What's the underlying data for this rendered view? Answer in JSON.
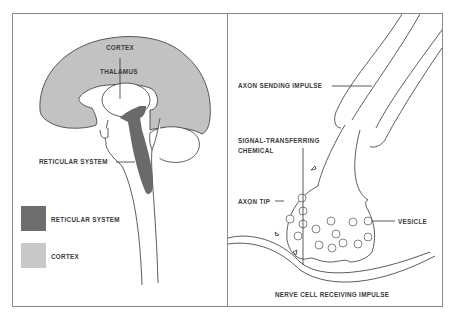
{
  "left_panel": {
    "title": "Brain cross-section",
    "labels": {
      "cortex": "CORTEX",
      "thalamus": "THALAMUS",
      "reticular_system": "RETICULAR SYSTEM"
    },
    "legend": [
      {
        "label": "RETICULAR  SYSTEM",
        "color": "#6e6e6e"
      },
      {
        "label": "CORTEX",
        "color": "#c8c8c8"
      }
    ]
  },
  "right_panel": {
    "title": "Synapse",
    "labels": {
      "axon_sending": "AXON SENDING IMPULSE",
      "signal_line1": "SIGNAL-TRANSFERRING",
      "signal_line2": "CHEMICAL",
      "axon_tip": "AXON TIP",
      "vesicle": "VESICLE",
      "nerve_cell": "NERVE CELL RECEIVING IMPULSE"
    }
  },
  "colors": {
    "cortex_fill": "#c2c2c2",
    "reticular_fill": "#6a6a6a",
    "line": "#333333",
    "frame": "#8a8a8a"
  }
}
